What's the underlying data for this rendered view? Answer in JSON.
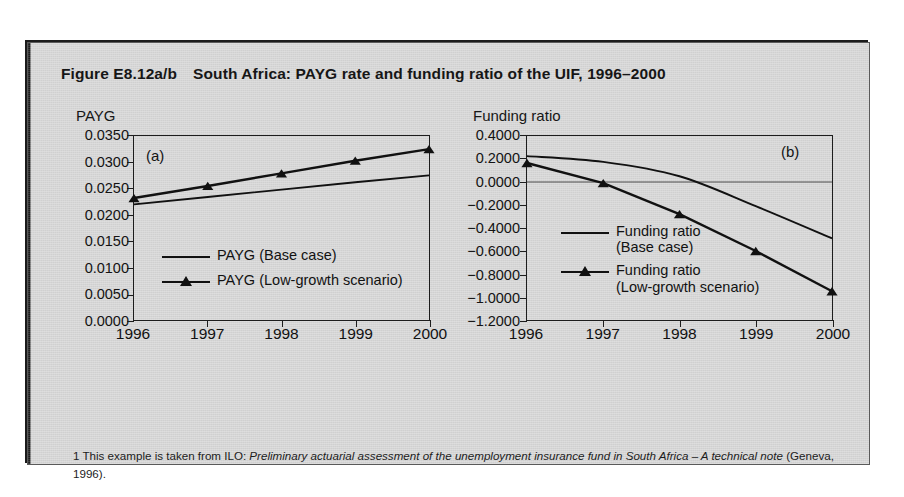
{
  "figure": {
    "number": "Figure E8.12a/b",
    "title": "South Africa: PAYG rate and funding ratio of the UIF, 1996–2000",
    "footnote_parts": {
      "p1": "1 This example is taken from ILO: ",
      "p2_italic": "Preliminary actuarial assessment of the unemployment insurance fund in South Africa – A technical note",
      "p3": " (Geneva, 1996)."
    },
    "background_color": "#d7d7d7",
    "line_color": "#111111"
  },
  "chart_data": [
    {
      "type": "line",
      "panel_tag": "(a)",
      "title": "PAYG",
      "xlabel": "",
      "ylabel": "PAYG",
      "x": [
        1996,
        1997,
        1998,
        1999,
        2000
      ],
      "xticklabels": [
        "1996",
        "1997",
        "1998",
        "1999",
        "2000"
      ],
      "yticks": [
        0.0,
        0.005,
        0.01,
        0.015,
        0.02,
        0.025,
        0.03,
        0.035
      ],
      "yticklabels": [
        "0.0000",
        "0.0050",
        "0.0100",
        "0.0150",
        "0.0200",
        "0.0250",
        "0.0300",
        "0.0350"
      ],
      "ylim": [
        0.0,
        0.035
      ],
      "grid": false,
      "legend_position": "inside-lower-left",
      "series": [
        {
          "name": "PAYG (Base case)",
          "marker": "none",
          "values": [
            0.022,
            0.0234,
            0.0248,
            0.0262,
            0.0275
          ]
        },
        {
          "name": "PAYG (Low-growth scenario)",
          "marker": "triangle",
          "values": [
            0.0232,
            0.0255,
            0.0279,
            0.0303,
            0.0325
          ]
        }
      ]
    },
    {
      "type": "line",
      "panel_tag": "(b)",
      "title": "Funding ratio",
      "xlabel": "",
      "ylabel": "Funding ratio",
      "x": [
        1996,
        1997,
        1998,
        1999,
        2000
      ],
      "xticklabels": [
        "1996",
        "1997",
        "1998",
        "1999",
        "2000"
      ],
      "yticks": [
        0.4,
        0.2,
        0.0,
        -0.2,
        -0.4,
        -0.6,
        -0.8,
        -1.0,
        -1.2
      ],
      "yticklabels": [
        "0.4000",
        "0.2000",
        "0.0000",
        "−0.2000",
        "−0.4000",
        "−0.6000",
        "−0.8000",
        "−1.0000",
        "−1.2000"
      ],
      "ylim": [
        -1.2,
        0.4
      ],
      "zero_line": true,
      "grid": false,
      "legend_position": "inside-lower-left",
      "series": [
        {
          "name": "Funding ratio (Base case)",
          "label_line1": "Funding ratio",
          "label_line2": "(Base case)",
          "marker": "none",
          "values": [
            0.225,
            0.175,
            0.05,
            -0.21,
            -0.49
          ]
        },
        {
          "name": "Funding ratio (Low-growth scenario)",
          "label_line1": "Funding ratio",
          "label_line2": "(Low-growth scenario)",
          "marker": "triangle",
          "values": [
            0.165,
            -0.01,
            -0.28,
            -0.6,
            -0.95
          ]
        }
      ]
    }
  ]
}
